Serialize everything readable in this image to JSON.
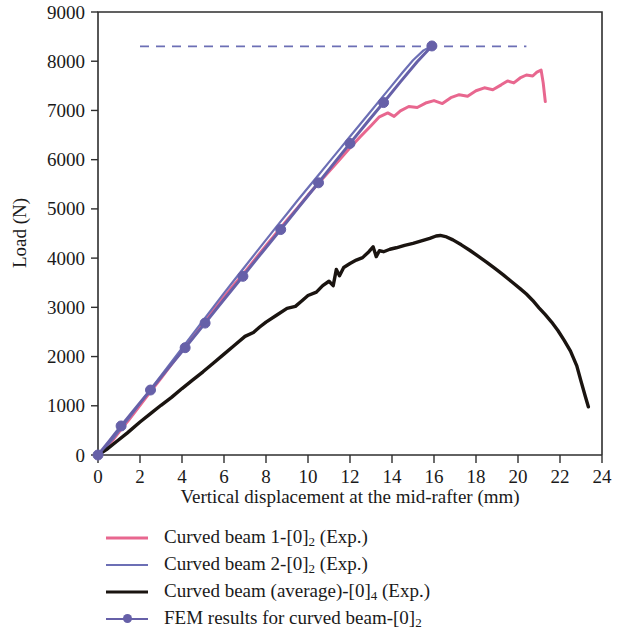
{
  "chart_data": {
    "type": "line",
    "title": "",
    "xlabel": "Vertical displacement at the mid-rafter (mm)",
    "ylabel": "Load (N)",
    "xlim": [
      0,
      24
    ],
    "ylim": [
      0,
      9000
    ],
    "xticks": [
      0,
      2,
      4,
      6,
      8,
      10,
      12,
      14,
      16,
      18,
      20,
      22,
      24
    ],
    "yticks": [
      0,
      1000,
      2000,
      3000,
      4000,
      5000,
      6000,
      7000,
      8000,
      9000
    ],
    "xtick_labels": [
      "0",
      "2",
      "4",
      "6",
      "8",
      "10",
      "12",
      "14",
      "16",
      "18",
      "20",
      "22",
      "24"
    ],
    "ytick_labels": [
      "0",
      "1000",
      "2000",
      "3000",
      "4000",
      "5000",
      "6000",
      "7000",
      "8000",
      "9000"
    ],
    "grid": false,
    "legend_position": "below",
    "annotations": [
      {
        "name": "fem-ultimate-load-guide",
        "type": "hline",
        "y": 8300,
        "x_start": 2.0,
        "x_end": 20.4,
        "style": "dashed",
        "color": "#6c6fb5"
      }
    ],
    "series": [
      {
        "name": "Curved beam 1-[0]2 (Exp.)",
        "label_plain": "Curved beam 1-[0]",
        "label_sub": "2",
        "label_suffix": " (Exp.)",
        "color": "#e8678f",
        "width": 3.0,
        "marker": "none",
        "points": [
          [
            0,
            0
          ],
          [
            0.3,
            110
          ],
          [
            0.7,
            300
          ],
          [
            1.1,
            520
          ],
          [
            1.5,
            730
          ],
          [
            2.0,
            1010
          ],
          [
            2.5,
            1290
          ],
          [
            3.0,
            1560
          ],
          [
            3.5,
            1840
          ],
          [
            4.0,
            2120
          ],
          [
            4.5,
            2390
          ],
          [
            5.0,
            2660
          ],
          [
            5.5,
            2940
          ],
          [
            6.0,
            3210
          ],
          [
            6.5,
            3470
          ],
          [
            7.0,
            3720
          ],
          [
            7.5,
            3990
          ],
          [
            8.0,
            4250
          ],
          [
            8.5,
            4510
          ],
          [
            9.0,
            4770
          ],
          [
            9.5,
            5020
          ],
          [
            10.0,
            5280
          ],
          [
            10.5,
            5520
          ],
          [
            11.0,
            5760
          ],
          [
            11.5,
            6000
          ],
          [
            12.0,
            6240
          ],
          [
            12.5,
            6470
          ],
          [
            13.0,
            6690
          ],
          [
            13.4,
            6870
          ],
          [
            13.8,
            6950
          ],
          [
            14.1,
            6880
          ],
          [
            14.4,
            6990
          ],
          [
            14.8,
            7080
          ],
          [
            15.2,
            7060
          ],
          [
            15.6,
            7150
          ],
          [
            16.0,
            7200
          ],
          [
            16.4,
            7140
          ],
          [
            16.8,
            7260
          ],
          [
            17.2,
            7320
          ],
          [
            17.6,
            7290
          ],
          [
            18.0,
            7400
          ],
          [
            18.4,
            7460
          ],
          [
            18.8,
            7420
          ],
          [
            19.2,
            7520
          ],
          [
            19.5,
            7600
          ],
          [
            19.8,
            7560
          ],
          [
            20.1,
            7660
          ],
          [
            20.4,
            7720
          ],
          [
            20.7,
            7700
          ],
          [
            20.9,
            7780
          ],
          [
            21.1,
            7820
          ],
          [
            21.2,
            7560
          ],
          [
            21.3,
            7180
          ]
        ]
      },
      {
        "name": "Curved beam 2-[0]2 (Exp.)",
        "label_plain": "Curved beam 2-[0]",
        "label_sub": "2",
        "label_suffix": " (Exp.)",
        "color": "#6c6fb5",
        "width": 2.2,
        "marker": "none",
        "points": [
          [
            0,
            0
          ],
          [
            0.3,
            120
          ],
          [
            0.7,
            320
          ],
          [
            1.1,
            540
          ],
          [
            1.5,
            760
          ],
          [
            2.0,
            1050
          ],
          [
            2.5,
            1330
          ],
          [
            3.0,
            1610
          ],
          [
            3.5,
            1890
          ],
          [
            4.0,
            2170
          ],
          [
            4.5,
            2450
          ],
          [
            5.0,
            2730
          ],
          [
            5.5,
            3010
          ],
          [
            6.0,
            3290
          ],
          [
            6.5,
            3560
          ],
          [
            7.0,
            3830
          ],
          [
            7.5,
            4100
          ],
          [
            8.0,
            4370
          ],
          [
            8.5,
            4640
          ],
          [
            9.0,
            4900
          ],
          [
            9.5,
            5170
          ],
          [
            10.0,
            5430
          ],
          [
            10.5,
            5690
          ],
          [
            11.0,
            5950
          ],
          [
            11.5,
            6210
          ],
          [
            12.0,
            6470
          ],
          [
            12.5,
            6730
          ],
          [
            13.0,
            6990
          ],
          [
            13.5,
            7250
          ],
          [
            14.0,
            7510
          ],
          [
            14.5,
            7770
          ],
          [
            15.0,
            8020
          ],
          [
            15.5,
            8220
          ],
          [
            15.9,
            8310
          ]
        ]
      },
      {
        "name": "Curved beam (average)-[0]4 (Exp.)",
        "label_plain": "Curved beam (average)-[0]",
        "label_sub": "4",
        "label_suffix": " (Exp.)",
        "color": "#1a1410",
        "width": 3.4,
        "marker": "none",
        "points": [
          [
            0,
            0
          ],
          [
            0.4,
            110
          ],
          [
            0.9,
            280
          ],
          [
            1.4,
            450
          ],
          [
            2.0,
            670
          ],
          [
            2.5,
            840
          ],
          [
            3.0,
            1010
          ],
          [
            3.5,
            1170
          ],
          [
            4.0,
            1350
          ],
          [
            4.5,
            1520
          ],
          [
            5.0,
            1690
          ],
          [
            5.5,
            1870
          ],
          [
            6.0,
            2050
          ],
          [
            6.5,
            2230
          ],
          [
            7.0,
            2410
          ],
          [
            7.4,
            2490
          ],
          [
            7.7,
            2600
          ],
          [
            8.0,
            2700
          ],
          [
            8.5,
            2840
          ],
          [
            9.0,
            2980
          ],
          [
            9.4,
            3020
          ],
          [
            9.7,
            3130
          ],
          [
            10.0,
            3240
          ],
          [
            10.4,
            3310
          ],
          [
            10.7,
            3440
          ],
          [
            11.0,
            3530
          ],
          [
            11.2,
            3440
          ],
          [
            11.35,
            3770
          ],
          [
            11.5,
            3640
          ],
          [
            11.7,
            3810
          ],
          [
            12.0,
            3890
          ],
          [
            12.3,
            3960
          ],
          [
            12.6,
            4010
          ],
          [
            12.9,
            4130
          ],
          [
            13.1,
            4230
          ],
          [
            13.25,
            4030
          ],
          [
            13.4,
            4150
          ],
          [
            13.6,
            4130
          ],
          [
            13.9,
            4180
          ],
          [
            14.2,
            4210
          ],
          [
            14.6,
            4260
          ],
          [
            15.0,
            4300
          ],
          [
            15.4,
            4350
          ],
          [
            15.8,
            4400
          ],
          [
            16.1,
            4450
          ],
          [
            16.3,
            4460
          ],
          [
            16.6,
            4430
          ],
          [
            16.9,
            4370
          ],
          [
            17.3,
            4270
          ],
          [
            17.7,
            4160
          ],
          [
            18.1,
            4040
          ],
          [
            18.5,
            3920
          ],
          [
            18.9,
            3790
          ],
          [
            19.3,
            3660
          ],
          [
            19.7,
            3520
          ],
          [
            20.1,
            3380
          ],
          [
            20.4,
            3270
          ],
          [
            20.7,
            3140
          ],
          [
            21.0,
            2990
          ],
          [
            21.3,
            2850
          ],
          [
            21.6,
            2700
          ],
          [
            21.9,
            2530
          ],
          [
            22.2,
            2330
          ],
          [
            22.5,
            2110
          ],
          [
            22.8,
            1810
          ],
          [
            23.0,
            1500
          ],
          [
            23.2,
            1200
          ],
          [
            23.35,
            980
          ]
        ]
      },
      {
        "name": "FEM results for curved beam-[0]2",
        "label_plain": "FEM results for curved beam-[0]",
        "label_sub": "2",
        "label_suffix": "",
        "color": "#6660a8",
        "width": 3.0,
        "marker": "circle",
        "marker_size": 7,
        "points": [
          [
            0,
            0
          ],
          [
            0.55,
            290
          ],
          [
            1.1,
            590
          ],
          [
            1.75,
            930
          ],
          [
            2.5,
            1320
          ],
          [
            3.3,
            1740
          ],
          [
            4.15,
            2180
          ],
          [
            5.1,
            2680
          ],
          [
            6.0,
            3160
          ],
          [
            6.9,
            3630
          ],
          [
            7.8,
            4110
          ],
          [
            8.7,
            4580
          ],
          [
            9.6,
            5060
          ],
          [
            10.5,
            5530
          ],
          [
            11.3,
            5960
          ],
          [
            12.0,
            6330
          ],
          [
            12.8,
            6750
          ],
          [
            13.6,
            7160
          ],
          [
            14.4,
            7580
          ],
          [
            15.2,
            7990
          ],
          [
            15.9,
            8310
          ]
        ],
        "markers_at": [
          [
            0,
            0
          ],
          [
            1.1,
            590
          ],
          [
            2.5,
            1320
          ],
          [
            4.15,
            2180
          ],
          [
            5.1,
            2680
          ],
          [
            6.9,
            3630
          ],
          [
            8.7,
            4580
          ],
          [
            10.5,
            5530
          ],
          [
            12.0,
            6330
          ],
          [
            13.6,
            7160
          ],
          [
            15.9,
            8310
          ]
        ]
      }
    ]
  },
  "axes": {
    "x_title": "Vertical displacement at the mid-rafter (mm)",
    "y_title": "Load (N)"
  },
  "legend": {
    "items": [
      {
        "label_plain": "Curved beam 1-[0]",
        "sub": "2",
        "suffix": " (Exp.)",
        "color": "#e8678f",
        "marker": "none",
        "width": 3
      },
      {
        "label_plain": "Curved beam 2-[0]",
        "sub": "2",
        "suffix": " (Exp.)",
        "color": "#6c6fb5",
        "marker": "none",
        "width": 2
      },
      {
        "label_plain": "Curved beam (average)-[0]",
        "sub": "4",
        "suffix": " (Exp.)",
        "color": "#1a1410",
        "marker": "none",
        "width": 3
      },
      {
        "label_plain": "FEM results for curved beam-[0]",
        "sub": "2",
        "suffix": "",
        "color": "#6660a8",
        "marker": "circle",
        "width": 2
      }
    ]
  }
}
